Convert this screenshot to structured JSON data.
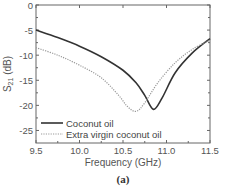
{
  "chart_data": {
    "type": "line",
    "title": "",
    "caption": "(a)",
    "xlabel": "Frequency (GHz)",
    "ylabel_main": "S",
    "ylabel_sub": "21",
    "ylabel_unit": " (dB)",
    "xlim": [
      9.5,
      11.5
    ],
    "ylim": [
      -27.5,
      0
    ],
    "xticks": [
      "9.5",
      "10.0",
      "10.5",
      "11.0",
      "11.5"
    ],
    "xtick_values": [
      9.5,
      10.0,
      10.5,
      11.0,
      11.5
    ],
    "yticks": [
      "0",
      "-5",
      "-10",
      "-15",
      "-20",
      "-25"
    ],
    "ytick_values": [
      0,
      -5,
      -10,
      -15,
      -20,
      -25
    ],
    "grid": false,
    "legend_position": "lower left",
    "series": [
      {
        "name": "Coconut oil",
        "style": "solid",
        "color": "#333333",
        "x": [
          9.5,
          9.75,
          10.0,
          10.25,
          10.5,
          10.65,
          10.75,
          10.85,
          10.95,
          11.1,
          11.3,
          11.5
        ],
        "values": [
          -5.0,
          -6.5,
          -8.2,
          -10.3,
          -13.0,
          -15.5,
          -18.0,
          -20.8,
          -18.5,
          -13.5,
          -9.5,
          -6.7
        ]
      },
      {
        "name": "Extra virgin coconut oil",
        "style": "dotted",
        "color": "#999999",
        "x": [
          9.5,
          9.75,
          10.0,
          10.25,
          10.45,
          10.55,
          10.65,
          10.75,
          10.9,
          11.1,
          11.3,
          11.5
        ],
        "values": [
          -8.5,
          -10.0,
          -12.0,
          -14.5,
          -18.0,
          -20.2,
          -21.2,
          -19.5,
          -15.5,
          -11.5,
          -8.8,
          -7.0
        ]
      }
    ]
  }
}
